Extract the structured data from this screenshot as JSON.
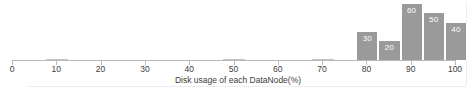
{
  "chart_data": {
    "type": "bar",
    "title": "",
    "xlabel": "Disk usage of each DataNode(%)",
    "ylabel": "",
    "xlim": [
      0,
      100
    ],
    "ylim": [
      0,
      60
    ],
    "grid": false,
    "legend": "none",
    "orientation": "vertical",
    "bar_color": "#9a9a9a",
    "label_color": "#ffffff",
    "xtick_labels": [
      "0",
      "10",
      "20",
      "30",
      "40",
      "50",
      "60",
      "70",
      "80",
      "90",
      "100"
    ],
    "xtick_values": [
      0,
      10,
      20,
      30,
      40,
      50,
      60,
      70,
      80,
      90,
      100
    ],
    "bins": [
      {
        "x_start": 5,
        "x_end": 10,
        "value": 0,
        "label": ""
      },
      {
        "x_start": 45,
        "x_end": 50,
        "value": 1,
        "label": ""
      },
      {
        "x_start": 65,
        "x_end": 70,
        "value": 0,
        "label": ""
      },
      {
        "x_start": 75,
        "x_end": 80,
        "value": 30,
        "label": "30"
      },
      {
        "x_start": 80,
        "x_end": 85,
        "value": 20,
        "label": "20"
      },
      {
        "x_start": 85,
        "x_end": 90,
        "value": 60,
        "label": "60"
      },
      {
        "x_start": 90,
        "x_end": 95,
        "value": 50,
        "label": "50"
      },
      {
        "x_start": 95,
        "x_end": 100,
        "value": 40,
        "label": "40"
      }
    ]
  }
}
